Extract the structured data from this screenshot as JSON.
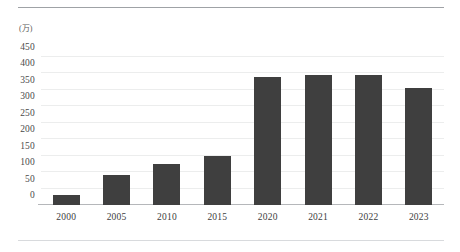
{
  "chart_data": {
    "type": "bar",
    "title": "",
    "subtitle": "",
    "xlabel": "",
    "ylabel": "",
    "unit_label": "(万)",
    "categories": [
      "2000",
      "2005",
      "2010",
      "2015",
      "2020",
      "2021",
      "2022",
      "2023"
    ],
    "values": [
      30,
      90,
      125,
      148,
      388,
      393,
      395,
      355
    ],
    "series": [
      {
        "name": "",
        "values": [
          30,
          90,
          125,
          148,
          388,
          393,
          395,
          355
        ]
      }
    ],
    "ylim": [
      0,
      500
    ],
    "yticks": [
      0,
      50,
      100,
      150,
      200,
      250,
      300,
      350,
      400,
      450
    ],
    "ytick_labels": [
      "0",
      "50",
      "100",
      "150",
      "200",
      "250",
      "300",
      "350",
      "400",
      "450"
    ],
    "grid": true,
    "grid_axis": "y",
    "legend": false,
    "legend_position": "none",
    "bar_color": "#3f3f3f",
    "gridline_color": "#eceded",
    "baseline_color": "#b5b7ba",
    "background_color": "#ffffff"
  },
  "decor": {
    "top_rule_color": "#9fa2a6",
    "bottom_rule_color": "#d8dadd"
  }
}
